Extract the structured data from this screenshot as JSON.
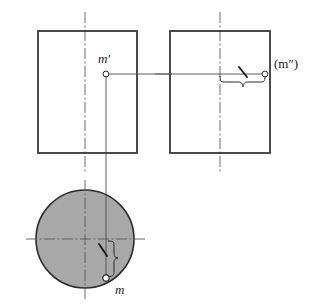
{
  "figure": {
    "type": "engineering-drawing",
    "canvas": {
      "width": 318,
      "height": 308
    },
    "colors": {
      "outline": "#2b2b2b",
      "thin_line": "#4d4d4d",
      "center_line": "#5a5a5a",
      "circle_fill": "#a8a8a8",
      "marker_fill": "#ffffff",
      "text": "#1a1a1a",
      "background": "#ffffff"
    },
    "views": {
      "front": {
        "name": "front-view-rectangle",
        "x": 38,
        "y": 31,
        "width": 99,
        "height": 122,
        "center_x": 85
      },
      "side": {
        "name": "side-view-rectangle",
        "x": 170,
        "y": 31,
        "width": 100,
        "height": 122,
        "center_x": 220
      },
      "top": {
        "name": "top-view-circle",
        "cx": 85,
        "cy": 239,
        "r": 49
      }
    },
    "points": [
      {
        "id": "m-prime",
        "label": "m′",
        "marker_x": 106,
        "marker_y": 74,
        "label_x": 104,
        "label_y": 63,
        "view": "front"
      },
      {
        "id": "m-double-prime",
        "label": "(m″)",
        "marker_x": 265,
        "marker_y": 74,
        "label_x": 274,
        "label_y": 68,
        "view": "side"
      },
      {
        "id": "m",
        "label": "m",
        "marker_x": 106,
        "marker_y": 278,
        "label_x": 115,
        "label_y": 294,
        "view": "top"
      }
    ],
    "projection_lines": [
      {
        "id": "horizontal-projection",
        "x1": 106,
        "y1": 74,
        "x2": 265,
        "y2": 74
      },
      {
        "id": "vertical-projection",
        "x1": 106,
        "y1": 74,
        "x2": 106,
        "y2": 278
      }
    ],
    "braces": [
      {
        "id": "side-view-brace",
        "orientation": "horizontal",
        "x1": 220,
        "x2": 265,
        "y": 82
      },
      {
        "id": "top-view-brace",
        "orientation": "vertical",
        "y1": 241,
        "y2": 278,
        "x": 117
      }
    ],
    "tick_marks": [
      {
        "id": "side-view-tick",
        "x1": 240,
        "y1": 68,
        "x2": 247,
        "y2": 77
      },
      {
        "id": "top-view-tick",
        "x1": 99,
        "y1": 245,
        "x2": 108,
        "y2": 255
      }
    ],
    "center_lines": [
      {
        "id": "front-view-vertical-centerline",
        "x1": 85,
        "y1": 12,
        "x2": 85,
        "y2": 172
      },
      {
        "id": "side-view-vertical-centerline",
        "x1": 220,
        "y1": 12,
        "x2": 220,
        "y2": 172
      },
      {
        "id": "side-view-horizontal-centerline",
        "x1": 155,
        "y1": 74,
        "x2": 285,
        "y2": 74
      },
      {
        "id": "top-view-vertical-centerline",
        "x1": 85,
        "y1": 180,
        "x2": 85,
        "y2": 300
      },
      {
        "id": "top-view-horizontal-centerline",
        "x1": 26,
        "y1": 239,
        "x2": 146,
        "y2": 239
      }
    ]
  }
}
